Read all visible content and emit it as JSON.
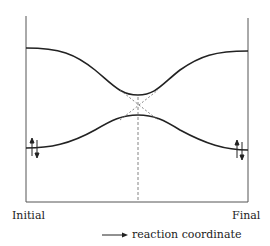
{
  "diagram": {
    "type": "correlation-diagram",
    "x_axis": {
      "start_label": "Initial",
      "end_label": "Final",
      "title": "reaction coordinate",
      "title_arrow": "right-arrow"
    },
    "curves": [
      {
        "name": "upper-state",
        "shape": "descends-to-avoided-crossing-then-rises",
        "start_level": "high",
        "end_level": "high"
      },
      {
        "name": "lower-state",
        "shape": "rises-to-avoided-crossing-then-descends",
        "start_level": "low",
        "end_level": "low",
        "start_marker": "paired-electrons",
        "end_marker": "paired-electrons"
      }
    ],
    "annotations": {
      "diabatic_crossing": "dashed-x-lines",
      "transition_marker": "dashed-vertical-line"
    },
    "colors": {
      "line": "#222222",
      "dashed": "#555555",
      "background": "#ffffff"
    }
  }
}
